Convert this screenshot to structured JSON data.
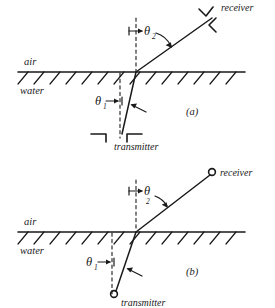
{
  "figure": {
    "background_color": "#ffffff",
    "ink_color": "#1a1a1a",
    "width": 275,
    "height": 308
  },
  "panels": [
    {
      "id": "a",
      "panel_label": "(a)",
      "media": {
        "upper_label": "air",
        "lower_label": "water"
      },
      "angles": {
        "upper": "θ",
        "upper_subscript": "2",
        "lower": "θ",
        "lower_subscript": "1"
      },
      "devices": {
        "receiver_label": "receiver",
        "receiver_symbol": "transducer-bracket",
        "transmitter_label": "transmitter",
        "transmitter_symbol": "transducer-bracket"
      }
    },
    {
      "id": "b",
      "panel_label": "(b)",
      "media": {
        "upper_label": "air",
        "lower_label": "water"
      },
      "angles": {
        "upper": "θ",
        "upper_subscript": "2",
        "lower": "θ",
        "lower_subscript": "1"
      },
      "devices": {
        "receiver_label": "receiver",
        "receiver_symbol": "open-circle",
        "transmitter_label": "transmitter",
        "transmitter_symbol": "open-circle"
      }
    }
  ]
}
